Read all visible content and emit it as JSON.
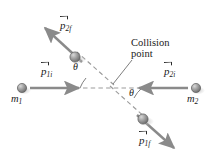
{
  "figure": {
    "background_color": "#ffffff",
    "arrow_color": "#808080",
    "dash_color": "#8f8f8f",
    "text_color": "#1a1a1a",
    "sphere_color": "#9a9a9a"
  },
  "labels": {
    "p2f": {
      "symbol": "p",
      "sub": "2f"
    },
    "p1i": {
      "symbol": "p",
      "sub": "1i"
    },
    "p2i": {
      "symbol": "p",
      "sub": "2i"
    },
    "p1f": {
      "symbol": "p",
      "sub": "1f"
    },
    "m1": {
      "symbol": "m",
      "sub": "1"
    },
    "m2": {
      "symbol": "m",
      "sub": "2"
    },
    "theta_upper": "θ",
    "theta_lower": "θ",
    "collision_line1": "Collision",
    "collision_line2": "point"
  },
  "objects": {
    "mass1": {
      "name": "m1",
      "cx": 22,
      "cy": 88,
      "r": 4.6
    },
    "mass2": {
      "name": "m2",
      "cx": 196,
      "cy": 88,
      "r": 4.6
    },
    "particle_2f": {
      "name": "p2f",
      "cx": 75,
      "cy": 57,
      "r": 5.0
    },
    "particle_1f": {
      "name": "p1f",
      "cx": 143,
      "cy": 119,
      "r": 5.0
    }
  },
  "vectors": {
    "p1i": {
      "x1": 30,
      "y1": 88,
      "x2": 83,
      "y2": 88,
      "direction": "right"
    },
    "p2i": {
      "x1": 188,
      "y1": 88,
      "x2": 135,
      "y2": 88,
      "direction": "left"
    },
    "p2f": {
      "x1": 83,
      "y1": 62,
      "x2": 44,
      "y2": 27,
      "direction": "upper-left"
    },
    "p1f": {
      "x1": 136,
      "y1": 114,
      "x2": 176,
      "y2": 149,
      "direction": "lower-right"
    }
  },
  "dashed_lines": {
    "axis": {
      "x1": 83,
      "y1": 88,
      "x2": 150,
      "y2": 88
    },
    "outgoing_upper": {
      "x1": 113,
      "y1": 84,
      "x2": 78,
      "y2": 53
    },
    "outgoing_lower": {
      "x1": 110,
      "y1": 86,
      "x2": 146,
      "y2": 118
    },
    "callout": {
      "x1": 116,
      "y1": 83,
      "x2": 131,
      "y2": 64
    }
  },
  "angles": {
    "upper": {
      "vertex_x": 113,
      "vertex_y": 84,
      "label_x": 74,
      "label_y": 68,
      "value_deg": 42
    },
    "lower": {
      "vertex_x": 110,
      "vertex_y": 86,
      "label_x": 130,
      "label_y": 92,
      "value_deg": 42
    }
  },
  "label_positions": {
    "p2f": {
      "x": 60,
      "y": 22
    },
    "p1i": {
      "x": 40,
      "y": 68
    },
    "p2i": {
      "x": 163,
      "y": 68
    },
    "p1f": {
      "x": 140,
      "y": 137
    },
    "m1": {
      "x": 12,
      "y": 94
    },
    "m2": {
      "x": 188,
      "y": 94
    },
    "collision": {
      "x": 133,
      "y": 43
    }
  }
}
